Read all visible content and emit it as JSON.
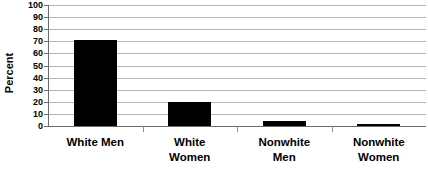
{
  "chart_data": {
    "type": "bar",
    "title": "",
    "xlabel": "",
    "ylabel": "Percent",
    "ylim": [
      0,
      100
    ],
    "ytick_step": 10,
    "grid": true,
    "legend": "none",
    "bar_color": "#000000",
    "gridline_color": "#b5b5b5",
    "axis_color": "#6b6b6b",
    "categories": [
      "White Men",
      "White Women",
      "Nonwhite Men",
      "Nonwhite Women"
    ],
    "category_lines": [
      [
        "White Men"
      ],
      [
        "White",
        "Women"
      ],
      [
        "Nonwhite",
        "Men"
      ],
      [
        "Nonwhite",
        "Women"
      ]
    ],
    "values": [
      71,
      20,
      4,
      2
    ],
    "ytick_labels": [
      "100",
      "90",
      "80",
      "70",
      "60",
      "50",
      "40",
      "30",
      "20",
      "10",
      "0"
    ],
    "ytick_values": [
      100,
      90,
      80,
      70,
      60,
      50,
      40,
      30,
      20,
      10,
      0
    ]
  }
}
